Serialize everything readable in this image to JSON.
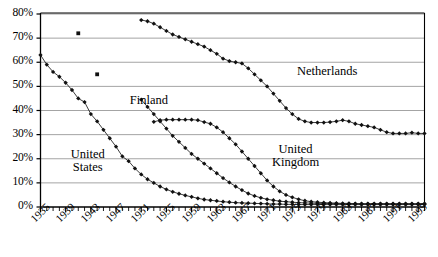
{
  "chart_data": {
    "type": "line",
    "title": "",
    "xlabel": "",
    "ylabel": "",
    "xlim": [
      1935,
      1996
    ],
    "ylim": [
      0,
      0.8
    ],
    "y_tick_labels": [
      "0%",
      "10%",
      "20%",
      "30%",
      "40%",
      "50%",
      "60%",
      "70%",
      "80%"
    ],
    "y_tick_values": [
      0,
      10,
      20,
      30,
      40,
      50,
      60,
      70,
      80
    ],
    "x_tick_labels": [
      "1935",
      "1939",
      "1943",
      "1947",
      "1951",
      "1955",
      "1959",
      "1963",
      "1967",
      "1971",
      "1975",
      "1979",
      "1983",
      "1987",
      "1991",
      "1995"
    ],
    "x_tick_values": [
      1935,
      1939,
      1943,
      1947,
      1951,
      1955,
      1959,
      1963,
      1967,
      1971,
      1975,
      1979,
      1983,
      1987,
      1991,
      1995
    ],
    "x_minor_tick_interval": 1,
    "grid": "horizontal",
    "legend": "inline-annotations",
    "marker": "filled-diamond",
    "series": [
      {
        "name": "United States",
        "label_x": 1942.5,
        "label_y": 19,
        "x": [
          1935,
          1936,
          1937,
          1938,
          1939,
          1940,
          1941,
          1942,
          1943,
          1944,
          1945,
          1946,
          1947,
          1948,
          1949,
          1950,
          1951,
          1952,
          1953,
          1954,
          1955,
          1956,
          1957,
          1958,
          1959,
          1960,
          1961,
          1962,
          1963,
          1964,
          1965,
          1966,
          1967,
          1968,
          1969,
          1970,
          1971,
          1972,
          1973,
          1974,
          1975,
          1976,
          1977,
          1978,
          1979,
          1980,
          1981,
          1982,
          1983,
          1984,
          1985,
          1986,
          1987,
          1988,
          1989,
          1990,
          1991,
          1992,
          1993,
          1994,
          1995,
          1996
        ],
        "y": [
          63,
          59,
          56,
          54,
          51.5,
          48.5,
          45,
          43.5,
          38.5,
          35.5,
          32,
          28.5,
          25,
          21,
          19,
          16,
          13.5,
          11.5,
          10,
          8.5,
          7.3,
          6.3,
          5.5,
          4.8,
          4.2,
          3.6,
          3.1,
          2.8,
          2.5,
          2.2,
          2.0,
          1.8,
          1.7,
          1.6,
          1.5,
          1.4,
          1.3,
          1.2,
          1.2,
          1.1,
          1.1,
          1.0,
          1.0,
          1.0,
          1.0,
          1.0,
          1.0,
          1.0,
          1.0,
          1.0,
          1.0,
          1.0,
          1.0,
          1.0,
          1.0,
          1.0,
          1.0,
          1.0,
          1.0,
          1.0,
          1.0,
          1.0
        ]
      },
      {
        "name": "Finland",
        "label_x": 1952.2,
        "label_y": 44,
        "x": [
          1951,
          1952,
          1953,
          1954,
          1955,
          1956,
          1957,
          1958,
          1959,
          1960,
          1961,
          1962,
          1963,
          1964,
          1965,
          1966,
          1967,
          1968,
          1969,
          1970,
          1971,
          1972,
          1973,
          1974,
          1975,
          1976,
          1977,
          1978,
          1979,
          1980,
          1981,
          1982,
          1983,
          1984,
          1985,
          1986,
          1987,
          1988,
          1989,
          1990,
          1991,
          1992,
          1993,
          1994,
          1995,
          1996
        ],
        "y": [
          44.5,
          41.5,
          38.5,
          35.5,
          32.5,
          29.5,
          27.0,
          24.5,
          22.0,
          20.0,
          18.0,
          16.0,
          14.0,
          12.0,
          10.2,
          8.5,
          7.0,
          5.6,
          4.6,
          3.8,
          3.2,
          2.8,
          2.4,
          2.2,
          2.0,
          1.8,
          1.7,
          1.6,
          1.5,
          1.5,
          1.4,
          1.4,
          1.3,
          1.3,
          1.3,
          1.2,
          1.2,
          1.2,
          1.2,
          1.2,
          1.2,
          1.2,
          1.2,
          1.2,
          1.2,
          1.2
        ]
      },
      {
        "name": "United Kingdom",
        "label_x": 1975.5,
        "label_y": 21,
        "x": [
          1953,
          1954,
          1955,
          1956,
          1957,
          1958,
          1959,
          1960,
          1961,
          1962,
          1963,
          1964,
          1965,
          1966,
          1967,
          1968,
          1969,
          1970,
          1971,
          1972,
          1973,
          1974,
          1975,
          1976,
          1977,
          1978,
          1979,
          1980,
          1981,
          1982,
          1983,
          1984,
          1985,
          1986,
          1987,
          1988,
          1989,
          1990,
          1991,
          1992,
          1993,
          1994,
          1995,
          1996
        ],
        "y": [
          35.3,
          36.0,
          36.2,
          36.2,
          36.2,
          36.2,
          36.2,
          36.0,
          35.2,
          34.5,
          33.0,
          31.0,
          28.5,
          26.0,
          23.0,
          20.0,
          17.0,
          14.0,
          11.0,
          8.5,
          6.5,
          5.0,
          4.0,
          3.2,
          2.6,
          2.2,
          2.0,
          1.8,
          1.7,
          1.6,
          1.5,
          1.5,
          1.4,
          1.4,
          1.4,
          1.4,
          1.4,
          1.4,
          1.4,
          1.4,
          1.4,
          1.4,
          1.4,
          1.4
        ]
      },
      {
        "name": "Netherlands",
        "label_x": 1980.5,
        "label_y": 56,
        "x": [
          1951,
          1952,
          1953,
          1954,
          1955,
          1956,
          1957,
          1958,
          1959,
          1960,
          1961,
          1962,
          1963,
          1964,
          1965,
          1966,
          1967,
          1968,
          1969,
          1970,
          1971,
          1972,
          1973,
          1974,
          1975,
          1976,
          1977,
          1978,
          1979,
          1980,
          1981,
          1982,
          1983,
          1984,
          1985,
          1986,
          1987,
          1988,
          1989,
          1990,
          1991,
          1992,
          1993,
          1994,
          1995,
          1996
        ],
        "y": [
          77.5,
          77.0,
          76.0,
          74.5,
          73.0,
          71.5,
          70.5,
          69.5,
          68.5,
          67.5,
          66.5,
          65.0,
          63.5,
          61.5,
          60.5,
          60.0,
          59.5,
          57.5,
          55.0,
          52.5,
          50.0,
          47.0,
          44.0,
          41.0,
          38.5,
          36.5,
          35.5,
          35.0,
          35.0,
          35.0,
          35.2,
          35.5,
          36.0,
          35.5,
          34.5,
          34.0,
          33.5,
          33.0,
          32.0,
          31.0,
          30.5,
          30.5,
          30.5,
          30.8,
          30.5,
          30.5
        ]
      }
    ],
    "outlier_points": [
      {
        "x": 1941,
        "y": 72,
        "marker": "square"
      },
      {
        "x": 1944,
        "y": 55,
        "marker": "square"
      }
    ],
    "colors": {
      "line": "#1a1a1a",
      "marker": "#111111",
      "grid": "#9a9a9a",
      "axis": "#000000",
      "background": "#ffffff"
    }
  }
}
